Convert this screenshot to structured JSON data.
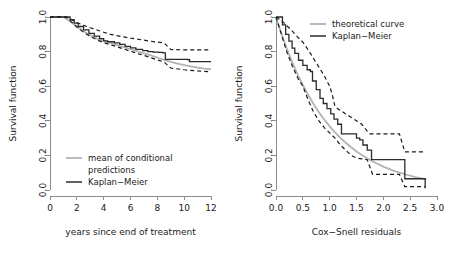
{
  "figure": {
    "background": "#ffffff",
    "colors": {
      "kaplan_meier": "#2b2b2b",
      "theoretical": "#b3b3b3",
      "confidence_band": "#1a1a1a",
      "axis": "#8c8c8c"
    }
  },
  "chart_data": [
    {
      "id": "left",
      "type": "line",
      "title": "",
      "xlabel": "years since end of treatment",
      "ylabel": "Survival function",
      "xlim": [
        0,
        12
      ],
      "ylim": [
        0,
        1
      ],
      "xticks": [
        0,
        2,
        4,
        6,
        8,
        10,
        12
      ],
      "xtick_labels": [
        "0",
        "2",
        "4",
        "6",
        "8",
        "10",
        "12"
      ],
      "yticks": [
        0.0,
        0.2,
        0.4,
        0.6,
        0.8,
        1.0
      ],
      "ytick_labels": [
        "0.0",
        "0.2",
        "0.4",
        "0.6",
        "0.8",
        "1.0"
      ],
      "grid": false,
      "legend_position": "bottom-left",
      "legend": [
        {
          "label": "mean of conditional predictions",
          "color": "#b3b3b3",
          "style": "solid"
        },
        {
          "label": "Kaplan−Meier",
          "color": "#2b2b2b",
          "style": "solid"
        }
      ],
      "series": [
        {
          "name": "mean of conditional predictions",
          "style": "solid",
          "color": "#b3b3b3",
          "x": [
            0.0,
            1.0,
            1.3,
            1.6,
            2.0,
            2.5,
            3.0,
            3.5,
            4.0,
            4.5,
            5.0,
            5.5,
            6.0,
            6.5,
            7.0,
            7.5,
            8.0,
            8.5,
            9.0,
            9.5,
            10.0,
            10.5,
            11.0,
            11.5,
            12.0
          ],
          "y": [
            1.0,
            1.0,
            0.985,
            0.968,
            0.945,
            0.918,
            0.895,
            0.875,
            0.862,
            0.85,
            0.838,
            0.826,
            0.814,
            0.802,
            0.79,
            0.778,
            0.766,
            0.752,
            0.74,
            0.73,
            0.722,
            0.714,
            0.707,
            0.702,
            0.698
          ]
        },
        {
          "name": "Kaplan−Meier",
          "style": "step",
          "color": "#2b2b2b",
          "x": [
            0.0,
            1.2,
            1.5,
            1.8,
            2.1,
            2.5,
            2.9,
            3.3,
            3.7,
            4.0,
            4.3,
            4.8,
            5.2,
            5.6,
            6.0,
            6.4,
            6.9,
            7.3,
            7.7,
            8.1,
            8.4,
            8.6,
            10.3,
            10.4,
            12.0
          ],
          "y": [
            1.0,
            1.0,
            0.985,
            0.965,
            0.945,
            0.925,
            0.905,
            0.89,
            0.875,
            0.862,
            0.857,
            0.85,
            0.842,
            0.83,
            0.822,
            0.813,
            0.806,
            0.8,
            0.797,
            0.795,
            0.793,
            0.755,
            0.753,
            0.742,
            0.742
          ]
        },
        {
          "name": "upper confidence limit",
          "style": "dashed",
          "color": "#1a1a1a",
          "x": [
            0.0,
            1.2,
            1.6,
            2.0,
            2.5,
            3.0,
            3.5,
            4.0,
            4.5,
            5.0,
            5.5,
            6.0,
            6.5,
            7.0,
            7.5,
            8.0,
            8.5,
            9.0,
            10.0,
            11.0,
            12.0
          ],
          "y": [
            1.0,
            1.0,
            0.985,
            0.968,
            0.952,
            0.938,
            0.925,
            0.912,
            0.9,
            0.892,
            0.885,
            0.878,
            0.872,
            0.866,
            0.86,
            0.855,
            0.85,
            0.812,
            0.81,
            0.81,
            0.81
          ]
        },
        {
          "name": "lower confidence limit",
          "style": "dashed",
          "color": "#1a1a1a",
          "x": [
            0.0,
            1.2,
            1.6,
            2.0,
            2.5,
            3.0,
            3.5,
            4.0,
            4.5,
            5.0,
            5.5,
            6.0,
            6.5,
            7.0,
            7.5,
            8.0,
            8.5,
            9.0,
            10.0,
            11.0,
            12.0
          ],
          "y": [
            1.0,
            1.0,
            0.972,
            0.942,
            0.912,
            0.888,
            0.868,
            0.852,
            0.84,
            0.828,
            0.815,
            0.802,
            0.79,
            0.778,
            0.765,
            0.752,
            0.74,
            0.705,
            0.695,
            0.688,
            0.683
          ]
        }
      ]
    },
    {
      "id": "right",
      "type": "line",
      "title": "",
      "xlabel": "Cox−Snell residuals",
      "ylabel": "Survival function",
      "xlim": [
        0,
        3
      ],
      "ylim": [
        0,
        1
      ],
      "xticks": [
        0.0,
        0.5,
        1.0,
        1.5,
        2.0,
        2.5,
        3.0
      ],
      "xtick_labels": [
        "0.0",
        "0.5",
        "1.0",
        "1.5",
        "2.0",
        "2.5",
        "3.0"
      ],
      "yticks": [
        0.0,
        0.2,
        0.4,
        0.6,
        0.8,
        1.0
      ],
      "ytick_labels": [
        "0.0",
        "0.2",
        "0.4",
        "0.6",
        "0.8",
        "1.0"
      ],
      "grid": false,
      "legend_position": "top-right",
      "legend": [
        {
          "label": "theoretical curve",
          "color": "#b3b3b3",
          "style": "solid"
        },
        {
          "label": "Kaplan−Meier",
          "color": "#2b2b2b",
          "style": "solid"
        }
      ],
      "series": [
        {
          "name": "theoretical curve",
          "style": "solid",
          "color": "#b3b3b3",
          "x": [
            0.0,
            0.1,
            0.2,
            0.3,
            0.4,
            0.5,
            0.6,
            0.7,
            0.8,
            0.9,
            1.0,
            1.1,
            1.2,
            1.3,
            1.4,
            1.5,
            1.6,
            1.7,
            1.8,
            1.9,
            2.0,
            2.2,
            2.4,
            2.6,
            2.8
          ],
          "y": [
            1.0,
            0.905,
            0.819,
            0.741,
            0.67,
            0.607,
            0.549,
            0.497,
            0.449,
            0.407,
            0.368,
            0.333,
            0.301,
            0.273,
            0.247,
            0.223,
            0.202,
            0.183,
            0.165,
            0.15,
            0.135,
            0.111,
            0.091,
            0.074,
            0.061
          ]
        },
        {
          "name": "Kaplan−Meier",
          "style": "step",
          "color": "#2b2b2b",
          "x": [
            0.0,
            0.12,
            0.18,
            0.24,
            0.3,
            0.35,
            0.42,
            0.5,
            0.58,
            0.64,
            0.68,
            0.75,
            0.82,
            0.88,
            0.95,
            1.02,
            1.08,
            1.15,
            1.22,
            1.32,
            1.42,
            1.5,
            1.56,
            1.62,
            1.7,
            1.78,
            2.35,
            2.4,
            2.72,
            2.78
          ],
          "y": [
            1.0,
            0.955,
            0.9,
            0.86,
            0.82,
            0.79,
            0.75,
            0.72,
            0.695,
            0.685,
            0.63,
            0.58,
            0.53,
            0.5,
            0.47,
            0.44,
            0.41,
            0.38,
            0.325,
            0.325,
            0.325,
            0.3,
            0.29,
            0.26,
            0.23,
            0.175,
            0.175,
            0.065,
            0.065,
            0.01
          ]
        },
        {
          "name": "upper confidence limit",
          "style": "dashed",
          "color": "#1a1a1a",
          "x": [
            0.0,
            0.1,
            0.2,
            0.3,
            0.4,
            0.5,
            0.6,
            0.7,
            0.8,
            0.9,
            1.0,
            1.05,
            1.1,
            1.2,
            1.3,
            1.4,
            1.5,
            1.6,
            1.7,
            1.75,
            2.0,
            2.3,
            2.4,
            2.6,
            2.78
          ],
          "y": [
            1.0,
            0.98,
            0.95,
            0.92,
            0.885,
            0.855,
            0.81,
            0.76,
            0.71,
            0.66,
            0.6,
            0.55,
            0.48,
            0.46,
            0.44,
            0.42,
            0.4,
            0.38,
            0.34,
            0.325,
            0.325,
            0.325,
            0.22,
            0.22,
            0.22
          ]
        },
        {
          "name": "lower confidence limit",
          "style": "dashed",
          "color": "#1a1a1a",
          "x": [
            0.0,
            0.1,
            0.2,
            0.3,
            0.4,
            0.5,
            0.6,
            0.7,
            0.8,
            0.9,
            1.0,
            1.1,
            1.2,
            1.3,
            1.4,
            1.5,
            1.6,
            1.7,
            1.8,
            2.0,
            2.3,
            2.4,
            2.6,
            2.78
          ],
          "y": [
            1.0,
            0.9,
            0.8,
            0.72,
            0.65,
            0.6,
            0.52,
            0.45,
            0.4,
            0.36,
            0.33,
            0.3,
            0.26,
            0.23,
            0.2,
            0.185,
            0.18,
            0.175,
            0.09,
            0.09,
            0.09,
            0.02,
            0.02,
            0.02
          ]
        }
      ]
    }
  ]
}
